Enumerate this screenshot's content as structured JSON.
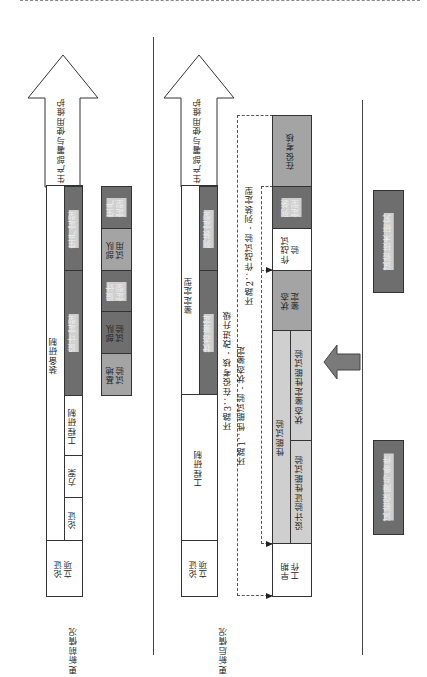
{
  "colors": {
    "dark": "#6e6e6e",
    "mid": "#a4a4a4",
    "light": "#cfcfcf",
    "line": "#444444"
  },
  "before": {
    "label": "更新前情况",
    "arrow_label": "生产部署与使用维护",
    "outer_label": "装备研制",
    "stage_start": "论证\n立项",
    "inner": [
      {
        "label": "论证"
      },
      {
        "label": "方案"
      },
      {
        "label": "工程研制"
      },
      {
        "label": "设计定型"
      },
      {
        "label": "生产定型"
      }
    ],
    "tests": [
      {
        "label": "基地\n试验"
      },
      {
        "label": "部队\n试验"
      },
      {
        "label": "设计\n定型"
      },
      {
        "label": "部队\n试用"
      },
      {
        "label": "生产\n定型"
      }
    ]
  },
  "after": {
    "label": "更新后情况",
    "arrow_label": "生产部署与使用维护",
    "stage_start": "论证\n立项",
    "engineering": "工程研制",
    "appraisal": "鉴定定型",
    "appraisal_inner": [
      {
        "label": "状态鉴定"
      },
      {
        "label": "列装定型"
      }
    ],
    "tests": {
      "early": "早期\n工作",
      "performance": "性能试验",
      "design_verify": "设计验证性能试验",
      "state_verify": "状态鉴定性能试验",
      "state_appraisal": "状态\n鉴定",
      "combat_test": "作战试\n验",
      "fielding": "列装\n定型",
      "in_service": "在役考核"
    },
    "loops": [
      {
        "label": "环路1：性能试验 - 状态鉴定"
      },
      {
        "label": "环路2：作战试验 - 列装定型"
      },
      {
        "label": "环路3：在役考核 - 改进升级"
      }
    ]
  },
  "support": [
    {
      "label": "试验技术研究"
    },
    {
      "label": "试验保障与条件"
    }
  ]
}
